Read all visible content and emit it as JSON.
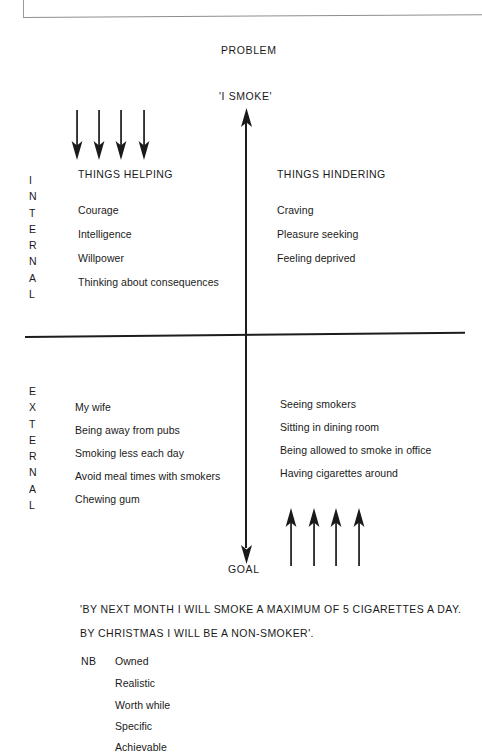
{
  "diagram": {
    "top_label": "PROBLEM",
    "problem_statement": "'I SMOKE'",
    "bottom_label": "GOAL",
    "axis_row_labels": {
      "upper": "INTERNAL",
      "lower": "EXTERNAL"
    },
    "quadrants": {
      "internal_helping": {
        "heading": "THINGS HELPING",
        "items": [
          "Courage",
          "Intelligence",
          "Willpower",
          "Thinking about consequences"
        ]
      },
      "internal_hindering": {
        "heading": "THINGS HINDERING",
        "items": [
          "Craving",
          "Pleasure seeking",
          "Feeling deprived"
        ]
      },
      "external_helping": {
        "heading": "",
        "items": [
          "My wife",
          "Being away from pubs",
          "Smoking less each day",
          "Avoid meal times with smokers",
          "Chewing gum"
        ]
      },
      "external_hindering": {
        "heading": "",
        "items": [
          "Seeing smokers",
          "Sitting in dining room",
          "Being allowed to smoke in office",
          "Having cigarettes around"
        ]
      }
    },
    "force_arrows": {
      "helping_down_count": 4,
      "hindering_up_count": 4
    }
  },
  "goal_statement": {
    "line1": "'BY NEXT MONTH I WILL SMOKE A MAXIMUM OF 5 CIGARETTES A DAY.",
    "line2": "BY CHRISTMAS I WILL BE A NON-SMOKER'."
  },
  "nb": {
    "label": "NB",
    "criteria": [
      "Owned",
      "Realistic",
      "Worth while",
      "Specific",
      "Achievable"
    ]
  },
  "colors": {
    "ink": "#1a1a1a",
    "rule": "#1d1d1d",
    "paper": "#ffffff",
    "scan_edge": "#8e8e8e"
  }
}
